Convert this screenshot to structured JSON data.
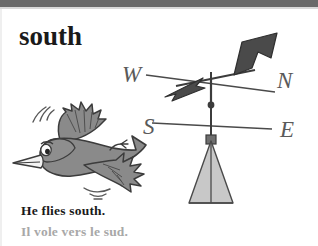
{
  "page": {
    "width": 318,
    "height": 246,
    "background": "#ffffff",
    "top_bar_color": "#6a6a6a"
  },
  "headword": {
    "text": "south",
    "color": "#1a1a1a"
  },
  "captions": {
    "english": "He flies south.",
    "french": "Il vole vers le sud.",
    "english_color": "#1a1a1a",
    "french_color": "#a8a8a8"
  },
  "illustration": {
    "bird": {
      "name": "flying-bird",
      "body_color": "#8a8a8a",
      "outline_color": "#3c3c3c",
      "beak_color": "#f2f2f2",
      "eye_color": "#ffffff",
      "motion_lines": 3
    },
    "weather_vane": {
      "name": "weather-vane",
      "arrow_color": "#4a4a4a",
      "pole_color": "#3c3c3c",
      "base_fill": "#c8c8c8",
      "base_outline": "#4a4a4a",
      "compass_letters": [
        {
          "label": "W",
          "x": 122,
          "y": 82
        },
        {
          "label": "N",
          "x": 277,
          "y": 88
        },
        {
          "label": "S",
          "x": 143,
          "y": 134
        },
        {
          "label": "E",
          "x": 280,
          "y": 137
        }
      ],
      "letter_color": "#5a5a5a"
    }
  }
}
